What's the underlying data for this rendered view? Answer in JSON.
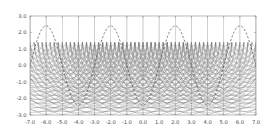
{
  "figure": {
    "title": "",
    "background_color": "#ffffff"
  },
  "chart_data": {
    "type": "line",
    "title": "",
    "subtitle": "",
    "xlabel": "",
    "ylabel": "",
    "xlim": [
      -7.0,
      7.0
    ],
    "ylim": [
      -3.0,
      3.0
    ],
    "grid": false,
    "legend": null,
    "legend_position": "none",
    "x_ticks": [
      -7.0,
      -6.0,
      -5.0,
      -4.0,
      -3.0,
      -2.0,
      -1.0,
      0.0,
      1.0,
      2.0,
      3.0,
      4.0,
      5.0,
      6.0,
      7.0
    ],
    "x_tick_labels": [
      "-7.0",
      "-6.0",
      "-5.0",
      "-4.0",
      "-3.0",
      "-2.0",
      "-1.0",
      "0.0",
      "1.0",
      "2.0",
      "3.0",
      "4.0",
      "5.0",
      "6.0",
      "7.0"
    ],
    "y_ticks": [
      -3.0,
      -2.0,
      -1.0,
      0.0,
      1.0,
      2.0,
      3.0
    ],
    "y_tick_labels": [
      "-3.0",
      "-2.0",
      "-1.0",
      "0.0",
      "1.0",
      "2.0",
      "3.0"
    ],
    "series": [
      {
        "name": "envelope",
        "style": "dashed",
        "color": "#555555",
        "description": "Dashed oscillating envelope curve with maxima near y=2.3 and minima near y=-2.5",
        "amplitude": 2.4,
        "period": 4.0,
        "x": [
          -7.0,
          -6.5,
          -6.0,
          -5.5,
          -5.0,
          -4.5,
          -4.0,
          -3.5,
          -3.0,
          -2.5,
          -2.0,
          -1.5,
          -1.0,
          -0.5,
          0.0,
          0.5,
          1.0,
          1.5,
          2.0,
          2.5,
          3.0,
          3.5,
          4.0,
          4.5,
          5.0,
          5.5,
          6.0,
          6.5,
          7.0
        ],
        "y": [
          -1.4,
          -0.3,
          0.9,
          1.9,
          2.3,
          1.9,
          0.9,
          -0.3,
          -1.4,
          -2.2,
          -2.5,
          -2.2,
          -1.4,
          -0.3,
          0.9,
          -0.3,
          -1.4,
          -2.2,
          -2.5,
          -2.2,
          -1.4,
          -0.3,
          0.9,
          1.9,
          2.3,
          1.9,
          0.9,
          -0.3,
          -1.4
        ]
      },
      {
        "name": "wavefront-arcs",
        "style": "solid",
        "color": "#707070",
        "description": "Nested circular wavefronts radiating downward from source points on the y=1.4 line",
        "source_y": 1.4,
        "source_x": [
          -7.0,
          -6.0,
          -5.0,
          -4.0,
          -3.0,
          -2.0,
          -1.0,
          0.0,
          1.0,
          2.0,
          3.0,
          4.0,
          5.0,
          6.0,
          7.0
        ],
        "radii": [
          0.25,
          0.5,
          0.75,
          1.0,
          1.25,
          1.5,
          1.75,
          2.0,
          2.25,
          2.5,
          2.75,
          3.0,
          3.25,
          3.5,
          3.75,
          4.0,
          4.25,
          4.5
        ]
      },
      {
        "name": "vertical-rays",
        "style": "solid",
        "color": "#808080",
        "description": "Vertical ray lines at integer x positions",
        "x": [
          -7.0,
          -6.0,
          -5.0,
          -4.0,
          -3.0,
          -2.0,
          -1.0,
          0.0,
          1.0,
          2.0,
          3.0,
          4.0,
          5.0,
          6.0,
          7.0
        ]
      },
      {
        "name": "dense-band",
        "style": "fill",
        "color": "#666666",
        "description": "Dark moire band of densely overlapping arcs between y=0.2 and y=1.4",
        "y_top": 1.4,
        "y_bottom": 0.2
      }
    ],
    "annotations": [],
    "axis_color": "#888888",
    "tick_label_color": "#4a4a4a"
  }
}
